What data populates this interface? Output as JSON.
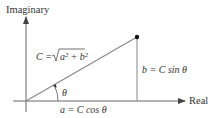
{
  "diagram": {
    "axes": {
      "vertical_label": "Imaginary",
      "horizontal_label": "Real"
    },
    "labels": {
      "hypotenuse_prefix": "C = ",
      "hypotenuse_radicand": "a² + b²",
      "angle": "θ",
      "adjacent": "a = C cos θ",
      "opposite": "b = C sin θ"
    },
    "geometry": {
      "origin": [
        26,
        101
      ],
      "point": [
        137,
        37
      ],
      "real_axis_end": [
        185,
        101
      ],
      "imag_axis_end": [
        26,
        16
      ]
    },
    "colors": {
      "axis": "#666666",
      "hypotenuse": "#888888",
      "text": "#333333",
      "point": "#111111"
    }
  }
}
